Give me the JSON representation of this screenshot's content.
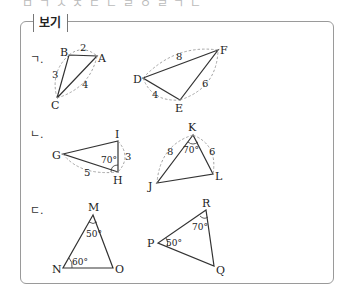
{
  "header_fragment": "ㅁ ㄱ ㅅ ㅈ ㄷ ㄴ ㄹ ㅇ   ㄹ   ㄱ ㄴ",
  "box": {
    "title": "보기"
  },
  "items": [
    {
      "label": "ㄱ.",
      "triangles": [
        {
          "vertices": [
            "A",
            "B",
            "C"
          ],
          "sides": {
            "AB": "2",
            "BC": "3",
            "CA": "4"
          }
        },
        {
          "vertices": [
            "D",
            "E",
            "F"
          ],
          "sides": {
            "DF": "8",
            "DE": "4",
            "EF": "6"
          }
        }
      ]
    },
    {
      "label": "ㄴ.",
      "triangles": [
        {
          "vertices": [
            "G",
            "H",
            "I"
          ],
          "sides": {
            "HI": "3",
            "GH": "5"
          },
          "angles": {
            "H": "70°"
          }
        },
        {
          "vertices": [
            "J",
            "K",
            "L"
          ],
          "sides": {
            "JK": "8",
            "KL": "6"
          },
          "angles": {
            "K": "70°"
          }
        }
      ]
    },
    {
      "label": "ㄷ.",
      "triangles": [
        {
          "vertices": [
            "M",
            "N",
            "O"
          ],
          "angles": {
            "M": "50°",
            "N": "60°"
          }
        },
        {
          "vertices": [
            "P",
            "Q",
            "R"
          ],
          "angles": {
            "P": "50°",
            "R": "70°"
          }
        }
      ]
    }
  ],
  "labels": {
    "A": "A",
    "B": "B",
    "C": "C",
    "D": "D",
    "E": "E",
    "F": "F",
    "G": "G",
    "H": "H",
    "I": "I",
    "J": "J",
    "K": "K",
    "L": "L",
    "M": "M",
    "N": "N",
    "O": "O",
    "P": "P",
    "Q": "Q",
    "R": "R"
  },
  "colors": {
    "line": "#333333",
    "dashed": "#9a9a9a",
    "border": "#9a9a9a"
  }
}
